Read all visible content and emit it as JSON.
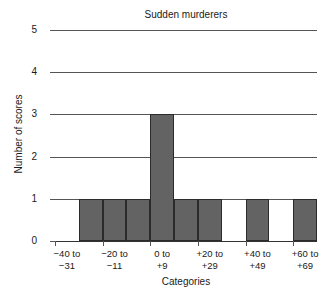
{
  "chart_data": {
    "type": "bar",
    "title": "Sudden murderers",
    "xlabel": "Categories",
    "ylabel": "Number of scores",
    "categories": [
      "-40 to\n-31",
      "-30 to\n-21",
      "-20 to\n-11",
      "-10 to\n-1",
      "0 to\n+9",
      "+10 to\n+19",
      "+20 to\n+29",
      "+30 to\n+39",
      "+40 to\n+49",
      "+50 to\n+59",
      "+60 to\n+69"
    ],
    "values": [
      0,
      1,
      1,
      1,
      3,
      1,
      1,
      0,
      1,
      0,
      1
    ],
    "ylim": [
      0,
      5
    ],
    "yticks": [
      "0",
      "1",
      "2",
      "3",
      "4",
      "5"
    ],
    "visible_xtick_labels": [
      "−40 to\n−31",
      "−20 to\n−11",
      "0 to\n+9",
      "+20 to\n+29",
      "+40 to\n+49",
      "+60 to\n+69"
    ],
    "visible_xtick_bins": [
      0,
      2,
      4,
      6,
      8,
      10
    ],
    "grid": true,
    "legend": "none",
    "bar_color": "#636363",
    "bar_edge_color": "#2b2b2b",
    "axis_color": "#555555"
  }
}
